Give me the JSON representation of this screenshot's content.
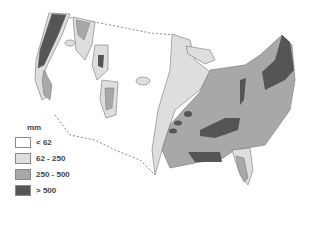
{
  "map": {
    "subject": "Precipitation map of the contiguous United States",
    "legend": {
      "unit": "mm",
      "classes": [
        {
          "label": "< 62",
          "color": "#ffffff"
        },
        {
          "label": "62 - 250",
          "color": "#dedede"
        },
        {
          "label": "250 - 500",
          "color": "#a8a8a8"
        },
        {
          "label": "> 500",
          "color": "#555555"
        }
      ]
    },
    "colors": {
      "outline": "#777777",
      "border_dash": "#888888"
    }
  }
}
